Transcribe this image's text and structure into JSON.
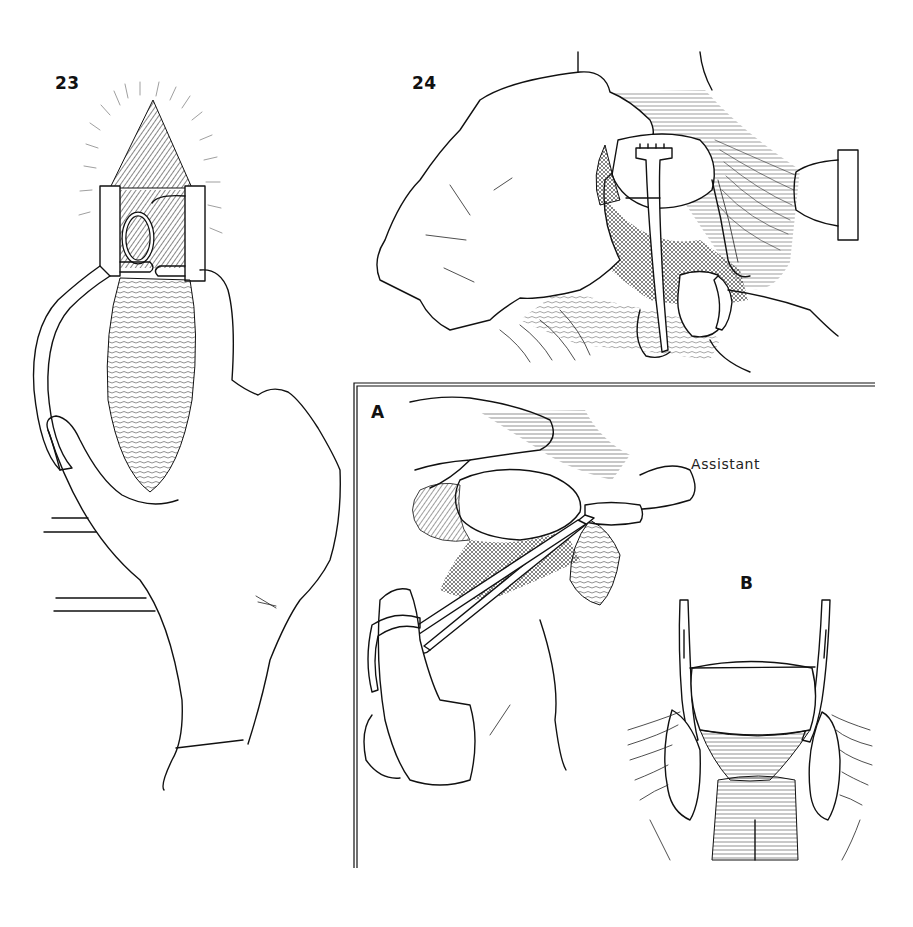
{
  "plate": {
    "background": "#ffffff",
    "ink_color": "#111111",
    "figures": [
      {
        "id": "23",
        "label": "23",
        "subject": "speculum retractor held by gloved hand exposing operative field"
      },
      {
        "id": "24",
        "label": "24",
        "subject": "gloved hands with tenaculum and retractor grasping tissue"
      },
      {
        "id": "A",
        "label": "A",
        "subject": "inset: clamp applied with assistant retracting",
        "annotation": "Assistant"
      },
      {
        "id": "B",
        "label": "B",
        "subject": "inset: two clamps placed on either side of structure"
      }
    ]
  },
  "labels": {
    "fig23": "23",
    "fig24": "24",
    "figA": "A",
    "figB": "B",
    "assistant": "Assistant"
  },
  "inset_frame": {
    "top_y": 383,
    "left_x": 354,
    "right_x": 875,
    "bottom_y": 868,
    "style": "double-line"
  }
}
